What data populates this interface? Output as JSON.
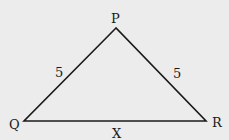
{
  "diagram": {
    "type": "triangle",
    "name": "PQR",
    "vertices": [
      {
        "label": "P",
        "x": 116,
        "y": 28
      },
      {
        "label": "Q",
        "x": 24,
        "y": 121
      },
      {
        "label": "R",
        "x": 206,
        "y": 121
      }
    ],
    "sides": [
      {
        "from": "P",
        "to": "Q",
        "length_label": "5"
      },
      {
        "from": "P",
        "to": "R",
        "length_label": "5"
      },
      {
        "from": "Q",
        "to": "R",
        "length_label": "X"
      }
    ],
    "labels": {
      "vertex_p": "P",
      "vertex_q": "Q",
      "vertex_r": "R",
      "side_pq": "5",
      "side_pr": "5",
      "side_qr": "X"
    },
    "colors": {
      "background": "#ececec",
      "stroke": "#1a1a1a"
    }
  }
}
